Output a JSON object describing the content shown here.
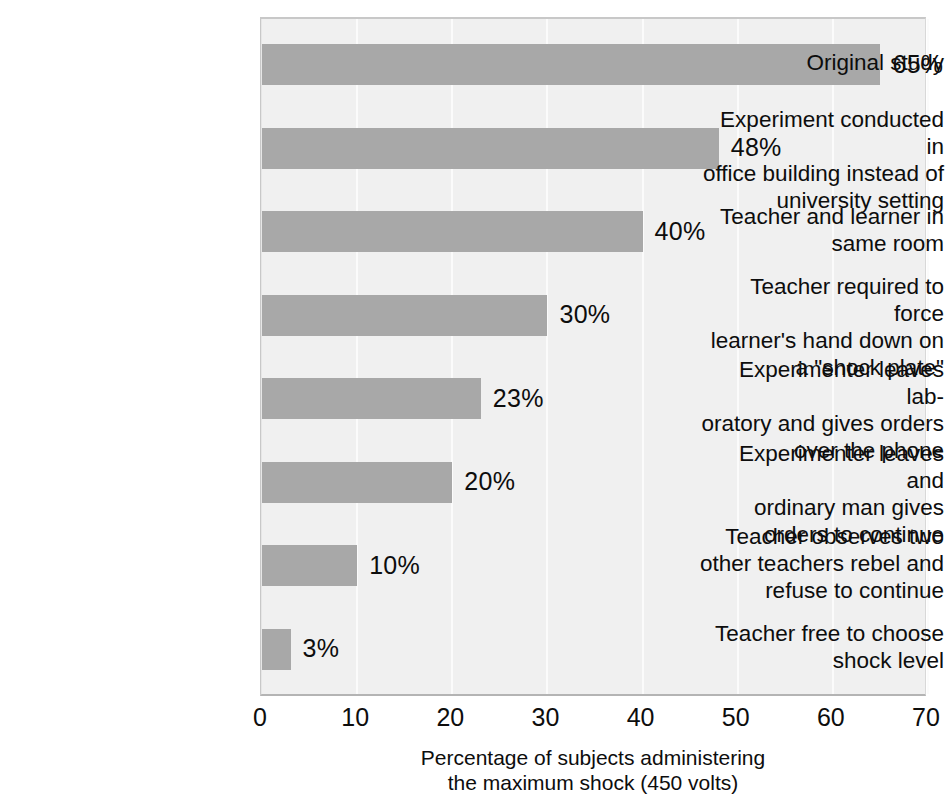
{
  "chart_data": {
    "type": "bar",
    "orientation": "horizontal",
    "title": "",
    "xlabel": "Percentage of subjects administering\nthe maximum shock (450 volts)",
    "ylabel": "",
    "xlim": [
      0,
      70
    ],
    "xticks": [
      0,
      10,
      20,
      30,
      40,
      50,
      60,
      70
    ],
    "xtick_labels": [
      "0",
      "10",
      "20",
      "30",
      "40",
      "50",
      "60",
      "70"
    ],
    "grid": true,
    "legend": "none",
    "value_suffix": "%",
    "categories": [
      "Original study",
      "Experiment conducted in\noffice building instead of\nuniversity setting",
      "Teacher and learner in\nsame room",
      "Teacher required to force\nlearner's hand down on\na \"shock plate\"",
      "Experimenter leaves lab-\noratory and gives orders\nover the phone",
      "Experimenter leaves and\nordinary man gives\norders to continue",
      "Teacher observes two\nother teachers rebel and\nrefuse to continue",
      "Teacher free to choose\nshock level"
    ],
    "values": [
      65,
      48,
      40,
      30,
      23,
      20,
      10,
      3
    ],
    "value_labels": [
      "65%",
      "48%",
      "40%",
      "30%",
      "23%",
      "20%",
      "10%",
      "3%"
    ],
    "colors": {
      "bar": "#a8a8a8",
      "plot_background": "#f0f0f0",
      "gridline": "#fbfbfb",
      "text": "#0d0d0d",
      "page_background": "#ffffff"
    }
  }
}
